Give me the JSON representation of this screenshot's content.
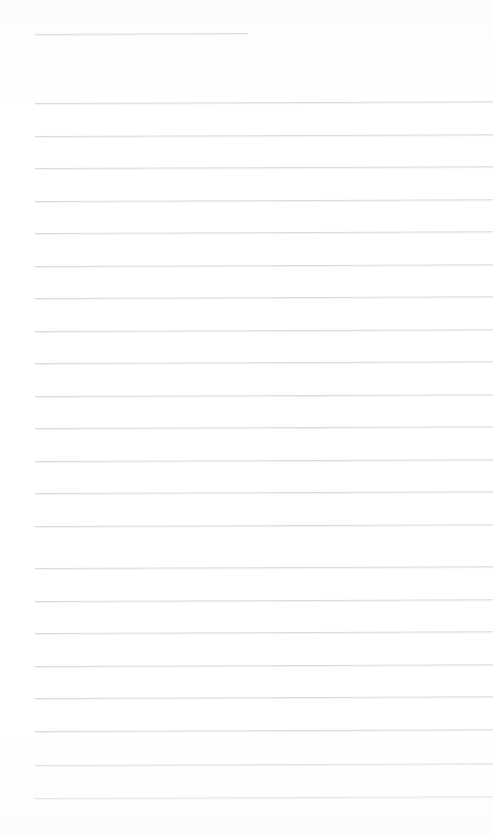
{
  "page": {
    "kind": "ruled-notebook-page",
    "title": "",
    "background_color": "#ffffff",
    "width": 493,
    "height": 836,
    "content_text": "",
    "is_blank": "true"
  },
  "ruling": {
    "line_color": "#d9dadd",
    "header_line_color": "#c9cacd",
    "line_thickness_px": 1,
    "line_spacing_px": 32.5,
    "left_margin_px": 35,
    "right_margin_px": 0,
    "body_line_count": 22,
    "header_line_count": 1
  },
  "header_rule": {
    "label": "heading-rule",
    "x": 35,
    "y": 34,
    "width": 213,
    "tilt_deg": -0.25
  },
  "body_rules": [
    {
      "y": 103,
      "x": 35,
      "width": 458,
      "tilt_deg": -0.22
    },
    {
      "y": 135.5,
      "x": 35,
      "width": 458,
      "tilt_deg": -0.22
    },
    {
      "y": 168,
      "x": 35,
      "width": 458,
      "tilt_deg": -0.22
    },
    {
      "y": 200.5,
      "x": 35,
      "width": 458,
      "tilt_deg": -0.22
    },
    {
      "y": 233,
      "x": 35,
      "width": 458,
      "tilt_deg": -0.22
    },
    {
      "y": 265.5,
      "x": 35,
      "width": 458,
      "tilt_deg": -0.22
    },
    {
      "y": 298,
      "x": 35,
      "width": 458,
      "tilt_deg": -0.22
    },
    {
      "y": 330.5,
      "x": 35,
      "width": 458,
      "tilt_deg": -0.22
    },
    {
      "y": 363,
      "x": 35,
      "width": 458,
      "tilt_deg": -0.22
    },
    {
      "y": 395.5,
      "x": 35,
      "width": 458,
      "tilt_deg": -0.22
    },
    {
      "y": 428,
      "x": 35,
      "width": 458,
      "tilt_deg": -0.22
    },
    {
      "y": 460.5,
      "x": 35,
      "width": 458,
      "tilt_deg": -0.22
    },
    {
      "y": 493,
      "x": 35,
      "width": 458,
      "tilt_deg": -0.22
    },
    {
      "y": 525.5,
      "x": 35,
      "width": 458,
      "tilt_deg": -0.22
    },
    {
      "y": 568,
      "x": 35,
      "width": 458,
      "tilt_deg": -0.22
    },
    {
      "y": 600.5,
      "x": 35,
      "width": 458,
      "tilt_deg": -0.22
    },
    {
      "y": 633,
      "x": 35,
      "width": 458,
      "tilt_deg": -0.22
    },
    {
      "y": 665.5,
      "x": 35,
      "width": 458,
      "tilt_deg": -0.22
    },
    {
      "y": 698,
      "x": 35,
      "width": 458,
      "tilt_deg": -0.22
    },
    {
      "y": 730.5,
      "x": 35,
      "width": 458,
      "tilt_deg": -0.22
    },
    {
      "y": 765,
      "x": 35,
      "width": 458,
      "tilt_deg": -0.22
    },
    {
      "y": 798,
      "x": 35,
      "width": 458,
      "tilt_deg": -0.22
    }
  ]
}
